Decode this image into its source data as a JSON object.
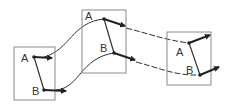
{
  "diagram": {
    "frames": [
      {
        "id": "frame-1",
        "label_a": "A",
        "label_b": "B"
      },
      {
        "id": "frame-2",
        "label_a": "A",
        "label_b": "B"
      },
      {
        "id": "frame-3",
        "label_a": "A",
        "label_b": "B"
      }
    ],
    "colors": {
      "box": "#8a8a8a",
      "line": "#333333",
      "vector": "#222222",
      "background": "#ffffff"
    }
  }
}
